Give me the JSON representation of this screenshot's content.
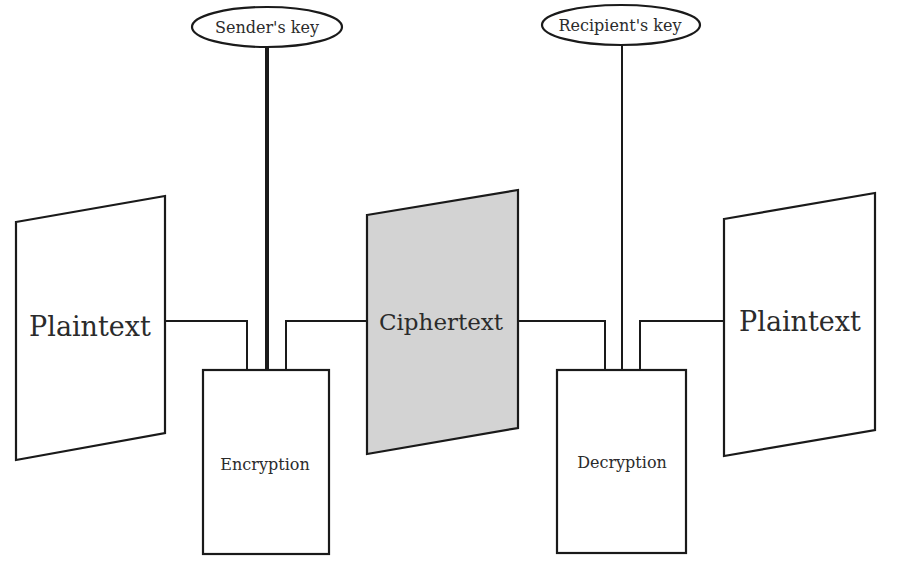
{
  "diagram": {
    "title": "",
    "colors": {
      "stroke": "#1a1a1a",
      "ciphertext_fill": "#d3d3d3",
      "background": "#ffffff",
      "text": "#2b2b2b"
    },
    "keys": {
      "sender": {
        "label": "Sender's key",
        "line": "thick"
      },
      "recipient": {
        "label": "Recipient's key",
        "line": "thin"
      }
    },
    "documents": {
      "plaintext_in": {
        "label": "Plaintext"
      },
      "ciphertext": {
        "label": "Ciphertext",
        "shaded": true
      },
      "plaintext_out": {
        "label": "Plaintext"
      }
    },
    "processes": {
      "encryption": {
        "label": "Encryption"
      },
      "decryption": {
        "label": "Decryption"
      }
    },
    "flow": [
      "Plaintext -> Encryption",
      "Sender's key -> Encryption",
      "Encryption -> Ciphertext",
      "Ciphertext -> Decryption",
      "Recipient's key -> Decryption",
      "Decryption -> Plaintext"
    ]
  }
}
